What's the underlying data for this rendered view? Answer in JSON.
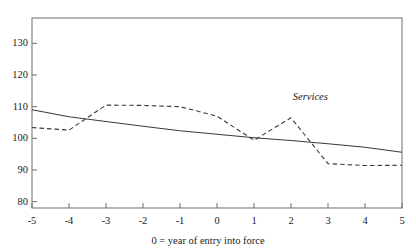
{
  "chart_data": {
    "type": "line",
    "title": "",
    "subtitle": "",
    "xlabel": "0 = year of entry into force",
    "ylabel": "",
    "xlim": [
      -5,
      5
    ],
    "ylim": [
      78,
      138
    ],
    "grid": false,
    "legend_position": "inline-annotation",
    "x": [
      -5,
      -4,
      -3,
      -2,
      -1,
      0,
      1,
      2,
      3,
      4,
      5
    ],
    "xticks": [
      "-5",
      "-4",
      "-3",
      "-2",
      "-1",
      "0",
      "1",
      "2",
      "3",
      "4",
      "5"
    ],
    "yticks": [
      "80",
      "90",
      "100",
      "110",
      "120",
      "130"
    ],
    "ytick_values": [
      80,
      90,
      100,
      110,
      120,
      130
    ],
    "series": [
      {
        "name": "Goods",
        "style": "solid",
        "color": "#3a3a3a",
        "values": [
          109.0,
          106.8,
          105.3,
          103.8,
          102.4,
          101.3,
          100.2,
          99.3,
          98.3,
          97.2,
          95.6
        ]
      },
      {
        "name": "Services",
        "style": "dashed",
        "color": "#3a3a3a",
        "values": [
          103.4,
          102.6,
          110.5,
          110.4,
          110.0,
          107.0,
          99.4,
          106.5,
          92.0,
          91.4,
          91.5
        ]
      }
    ],
    "annotations": [
      {
        "text": "Services",
        "x": 2.05,
        "y": 113.2
      },
      {
        "text": "Goods",
        "x": 5.85,
        "y": 100.0
      }
    ]
  },
  "axes": {
    "x_axis_name": "x-axis",
    "y_axis_name": "y-axis"
  }
}
